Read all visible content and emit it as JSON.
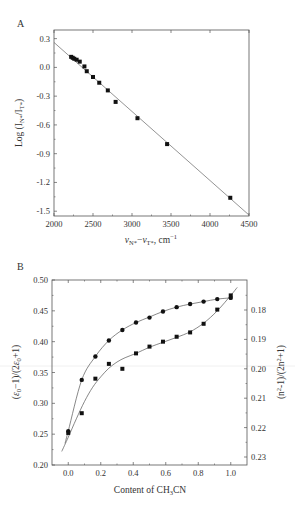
{
  "figure": {
    "panels": [
      "A",
      "B"
    ]
  },
  "chart_data": [
    {
      "panel": "A",
      "type": "scatter",
      "title": "",
      "xlabel": "νN*−νT*, cm⁻¹",
      "ylabel": "Log (IN*/IT*)",
      "xlim": [
        2000,
        4500
      ],
      "ylim": [
        -1.55,
        0.39
      ],
      "xticks": [
        2000,
        2500,
        3000,
        3500,
        4000,
        4500
      ],
      "yticks": [
        0.3,
        0.0,
        -0.3,
        -0.6,
        -0.9,
        -1.2,
        -1.5
      ],
      "ytick_labels": [
        "0.3",
        "0.0",
        "-0.3",
        "-0.6",
        "-0.9",
        "-1.2",
        "-1.5"
      ],
      "grid": false,
      "series": [
        {
          "name": "data",
          "marker": "square",
          "x": [
            2220,
            2240,
            2260,
            2290,
            2330,
            2390,
            2420,
            2500,
            2580,
            2690,
            2790,
            3070,
            3450,
            4260
          ],
          "y": [
            0.11,
            0.1,
            0.09,
            0.08,
            0.06,
            0.01,
            -0.04,
            -0.1,
            -0.16,
            -0.24,
            -0.36,
            -0.53,
            -0.8,
            -1.36
          ]
        }
      ],
      "fit_line": {
        "x": [
          2000,
          4500
        ],
        "y": [
          0.26,
          -1.54
        ]
      }
    },
    {
      "panel": "B",
      "type": "line",
      "title": "",
      "xlabel": "Content of CH3CN",
      "ylabel_left": "(ε0−1)/(2ε0+1)",
      "ylabel_right": "(n²−1)/(2n²+1)",
      "xlim": [
        -0.1,
        1.1
      ],
      "ylim_left": [
        0.2,
        0.5
      ],
      "ylim_right_ticks": [
        0.18,
        0.19,
        0.2,
        0.21,
        0.22,
        0.23
      ],
      "xticks": [
        0.0,
        0.2,
        0.4,
        0.6,
        0.8,
        1.0
      ],
      "xtick_labels": [
        "0.0",
        "0.2",
        "0.4",
        "0.6",
        "0.8",
        "1.0"
      ],
      "yticks_left": [
        0.2,
        0.25,
        0.3,
        0.35,
        0.4,
        0.45,
        0.5
      ],
      "ytick_labels_left": [
        "0.20",
        "0.25",
        "0.30",
        "0.35",
        "0.40",
        "0.45",
        "0.50"
      ],
      "ytick_labels_right": [
        "0.18",
        "0.19",
        "0.20",
        "0.21",
        "0.22",
        "0.23"
      ],
      "grid": false,
      "series": [
        {
          "name": "ε0 function (circles)",
          "marker": "circle",
          "x": [
            0.0,
            0.083,
            0.167,
            0.25,
            0.333,
            0.417,
            0.5,
            0.583,
            0.667,
            0.75,
            0.833,
            0.917,
            1.0
          ],
          "y": [
            0.255,
            0.338,
            0.376,
            0.402,
            0.419,
            0.431,
            0.439,
            0.449,
            0.456,
            0.461,
            0.465,
            0.469,
            0.471
          ]
        },
        {
          "name": "n function (squares)",
          "marker": "square",
          "x": [
            0.0,
            0.083,
            0.167,
            0.25,
            0.333,
            0.417,
            0.5,
            0.583,
            0.667,
            0.75,
            0.833,
            0.917,
            1.0
          ],
          "y": [
            0.252,
            0.284,
            0.34,
            0.364,
            0.356,
            0.381,
            0.392,
            0.4,
            0.408,
            0.415,
            0.429,
            0.452,
            0.475
          ]
        }
      ],
      "fit_curves": [
        {
          "name": "upper fit",
          "x": [
            -0.02,
            0.0,
            0.083,
            0.167,
            0.25,
            0.333,
            0.417,
            0.5,
            0.583,
            0.667,
            0.75,
            0.833,
            0.917,
            1.0
          ],
          "y": [
            0.235,
            0.255,
            0.338,
            0.376,
            0.402,
            0.419,
            0.431,
            0.44,
            0.449,
            0.456,
            0.461,
            0.465,
            0.469,
            0.471
          ]
        },
        {
          "name": "lower fit",
          "x": [
            -0.04,
            0.0,
            0.05,
            0.1,
            0.15,
            0.2,
            0.25,
            0.3,
            0.35,
            0.417,
            0.5,
            0.583,
            0.667,
            0.75,
            0.833,
            0.917,
            1.0,
            1.04
          ],
          "y": [
            0.222,
            0.245,
            0.275,
            0.303,
            0.326,
            0.343,
            0.357,
            0.367,
            0.374,
            0.381,
            0.391,
            0.399,
            0.407,
            0.416,
            0.43,
            0.45,
            0.475,
            0.488
          ]
        }
      ]
    }
  ]
}
